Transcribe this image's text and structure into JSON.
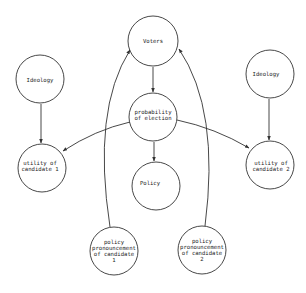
{
  "diagram": {
    "type": "directed-graph",
    "colors": {
      "stroke": "#333333",
      "text": "#222222",
      "background": "#ffffff"
    },
    "nodes": [
      {
        "id": "voters",
        "label": "Voters",
        "cx": 153,
        "cy": 41,
        "r": 25
      },
      {
        "id": "ideology_1",
        "label": "Ideology",
        "cx": 40,
        "cy": 79,
        "r": 24
      },
      {
        "id": "ideology_2",
        "label": "Ideology",
        "cx": 270,
        "cy": 74,
        "r": 24
      },
      {
        "id": "probability",
        "label": "probability\nof election",
        "cx": 153,
        "cy": 117,
        "r": 24
      },
      {
        "id": "utility_1",
        "label": "utility of\ncandidate 1",
        "cx": 42,
        "cy": 168,
        "r": 24
      },
      {
        "id": "utility_2",
        "label": "utility of\ncandidate 2",
        "cx": 270,
        "cy": 165,
        "r": 24
      },
      {
        "id": "policy",
        "label": "Policy",
        "cx": 156,
        "cy": 186,
        "r": 24
      },
      {
        "id": "pronouncement_1",
        "label": "policy\npronouncement\nof candidate\n1",
        "cx": 114,
        "cy": 251,
        "r": 24
      },
      {
        "id": "pronouncement_2",
        "label": "policy\npronouncement\nof candidate\n2",
        "cx": 202,
        "cy": 250,
        "r": 24
      }
    ],
    "edges": [
      {
        "from": "voters",
        "to": "probability"
      },
      {
        "from": "probability",
        "to": "policy"
      },
      {
        "from": "probability",
        "to": "utility_1"
      },
      {
        "from": "probability",
        "to": "utility_2"
      },
      {
        "from": "ideology_1",
        "to": "utility_1"
      },
      {
        "from": "ideology_2",
        "to": "utility_2"
      },
      {
        "from": "pronouncement_1",
        "to": "voters"
      },
      {
        "from": "pronouncement_2",
        "to": "voters"
      }
    ]
  }
}
